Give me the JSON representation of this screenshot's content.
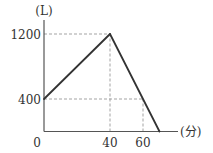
{
  "chart_data": {
    "type": "line",
    "title": "",
    "xlabel": "(分)",
    "ylabel": "(L)",
    "origin_label": "0",
    "x_ticks": [
      40,
      60
    ],
    "x_tick_labels": [
      "40",
      "60"
    ],
    "y_ticks": [
      400,
      1200
    ],
    "y_tick_labels": [
      "400",
      "1200"
    ],
    "xlim": [
      0,
      80
    ],
    "ylim": [
      0,
      1400
    ],
    "grid": false,
    "series": [
      {
        "name": "water",
        "x": [
          0,
          40,
          70
        ],
        "y": [
          400,
          1200,
          0
        ]
      }
    ],
    "guides": [
      {
        "type": "h",
        "y": 1200,
        "x_to": 40
      },
      {
        "type": "v",
        "x": 40,
        "y_to": 1200
      },
      {
        "type": "h",
        "y": 400,
        "x_to": 60
      },
      {
        "type": "v",
        "x": 60,
        "y_to": 400
      }
    ]
  },
  "colors": {
    "axis": "#555555",
    "line": "#333333",
    "guide": "#999999"
  }
}
